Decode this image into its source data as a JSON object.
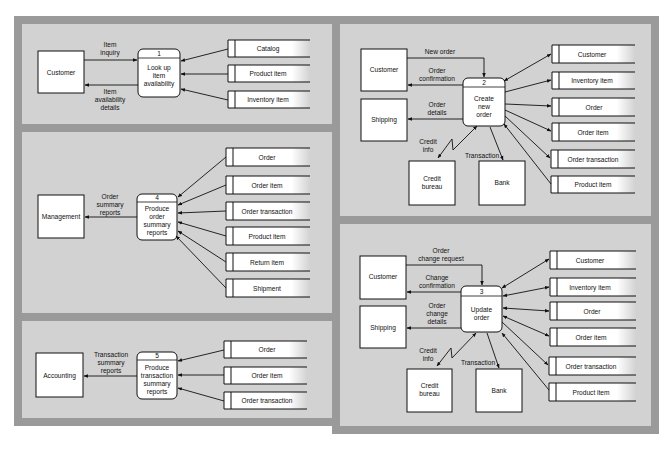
{
  "diagram_type": "Data flow diagrams (fragments)",
  "colors": {
    "frame": "#9a9a9a",
    "panel": "#d2d2d2",
    "box": "#ffffff",
    "line": "#111111"
  },
  "panels": {
    "p1": {
      "process": {
        "number": "1",
        "lines": [
          "Look up",
          "item",
          "availability"
        ]
      },
      "externals": {
        "customer": "Customer"
      },
      "flows": {
        "in": [
          "Item",
          "inquiry"
        ],
        "out": [
          "Item",
          "availability",
          "details"
        ]
      },
      "stores": [
        "Catalog",
        "Product item",
        "Inventory item"
      ]
    },
    "p2": {
      "process": {
        "number": "2",
        "lines": [
          "Create",
          "new",
          "order"
        ]
      },
      "externals": {
        "customer": "Customer",
        "shipping": "Shipping",
        "credit": [
          "Credit",
          "bureau"
        ],
        "bank": "Bank"
      },
      "flows": {
        "new_order": "New order",
        "confirmation": [
          "Order",
          "confirmation"
        ],
        "details": [
          "Order",
          "details"
        ],
        "credit_info": [
          "Credit",
          "info"
        ],
        "transaction": "Transaction"
      },
      "stores": [
        "Customer",
        "Inventory item",
        "Order",
        "Order item",
        "Order transaction",
        "Product item"
      ]
    },
    "p4": {
      "process": {
        "number": "4",
        "lines": [
          "Produce",
          "order",
          "summary",
          "reports"
        ]
      },
      "externals": {
        "management": "Management"
      },
      "flows": {
        "out": [
          "Order",
          "summary",
          "reports"
        ]
      },
      "stores": [
        "Order",
        "Order item",
        "Order transaction",
        "Product item",
        "Return item",
        "Shipment"
      ]
    },
    "p3": {
      "process": {
        "number": "3",
        "lines": [
          "Update",
          "order"
        ]
      },
      "externals": {
        "customer": "Customer",
        "shipping": "Shipping",
        "credit": [
          "Credit",
          "bureau"
        ],
        "bank": "Bank"
      },
      "flows": {
        "request": [
          "Order",
          "change request"
        ],
        "confirmation": [
          "Change",
          "confirmation"
        ],
        "details": [
          "Order",
          "change",
          "details"
        ],
        "credit_info": [
          "Credit",
          "info"
        ],
        "transaction": "Transaction"
      },
      "stores": [
        "Customer",
        "Inventory item",
        "Order",
        "Order item",
        "Order transaction",
        "Product item"
      ]
    },
    "p5": {
      "process": {
        "number": "5",
        "lines": [
          "Produce",
          "transaction",
          "summary",
          "reports"
        ]
      },
      "externals": {
        "accounting": "Accounting"
      },
      "flows": {
        "out": [
          "Transaction",
          "summary",
          "reports"
        ]
      },
      "stores": [
        "Order",
        "Order item",
        "Order transaction"
      ]
    }
  }
}
